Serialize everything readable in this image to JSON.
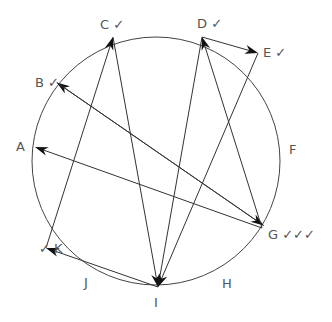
{
  "diagram": {
    "circle": {
      "cx": 156,
      "cy": 161,
      "r": 124,
      "stroke": "#444444"
    },
    "line_color": "#333333",
    "points": {
      "A": [
        35,
        147
      ],
      "B": [
        55,
        85
      ],
      "C": [
        113,
        37
      ],
      "D": [
        202,
        37
      ],
      "E": [
        258,
        53
      ],
      "G": [
        262,
        228
      ],
      "I": [
        158,
        287
      ],
      "K": [
        46,
        248
      ]
    },
    "labels": [
      {
        "id": "A",
        "text": "A",
        "x": 16,
        "y": 140
      },
      {
        "id": "B",
        "text": "B ✓",
        "x": 35,
        "y": 76
      },
      {
        "id": "C",
        "text": "C ✓",
        "x": 100,
        "y": 18
      },
      {
        "id": "D",
        "text": "D ✓",
        "x": 197,
        "y": 17
      },
      {
        "id": "E",
        "text": "E ✓",
        "x": 263,
        "y": 46
      },
      {
        "id": "F",
        "text": "F",
        "x": 289,
        "y": 143
      },
      {
        "id": "G",
        "text": "G ✓✓✓",
        "x": 268,
        "y": 228
      },
      {
        "id": "H",
        "text": "H",
        "x": 222,
        "y": 277
      },
      {
        "id": "I",
        "text": "I",
        "x": 154,
        "y": 296
      },
      {
        "id": "J",
        "text": "J",
        "x": 84,
        "y": 276
      },
      {
        "id": "K",
        "text": "✓ K",
        "x": 39,
        "y": 242
      }
    ],
    "arrows": [
      {
        "from": "G",
        "to": "A",
        "head": true
      },
      {
        "from": "G",
        "to": "B",
        "head": true,
        "offset": 3
      },
      {
        "from": "B",
        "to": "G",
        "head": true,
        "offset": -3
      },
      {
        "from": "K",
        "to": "C",
        "head": true
      },
      {
        "from": "C",
        "to": "I",
        "head": true
      },
      {
        "from": "I",
        "to": "D",
        "head": false
      },
      {
        "from": "G",
        "to": "D",
        "head": true
      },
      {
        "from": "D",
        "to": "E",
        "head": true
      },
      {
        "from": "E",
        "to": "I",
        "head": true
      },
      {
        "from": "I",
        "to": "K",
        "head": true
      }
    ]
  }
}
